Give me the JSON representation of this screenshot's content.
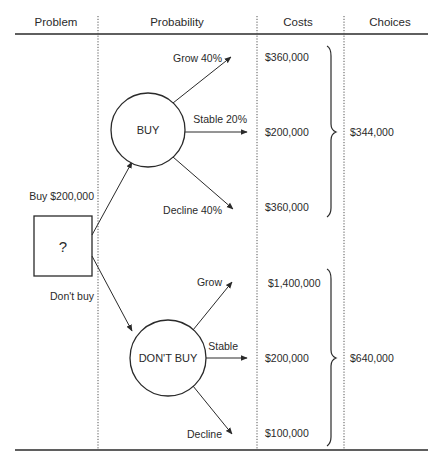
{
  "header": {
    "columns": [
      {
        "label": "Problem"
      },
      {
        "label": "Probability"
      },
      {
        "label": "Costs"
      },
      {
        "label": "Choices"
      }
    ]
  },
  "decision": {
    "symbol": "?",
    "buy_branch_label": "Buy $200,000",
    "dont_buy_branch_label": "Don't buy"
  },
  "nodes": {
    "buy": {
      "label": "BUY",
      "outcomes": [
        {
          "label": "Grow 40%",
          "cost": "$360,000"
        },
        {
          "label": "Stable 20%",
          "cost": "$200,000"
        },
        {
          "label": "Decline 40%",
          "cost": "$360,000"
        }
      ],
      "choice": "$344,000"
    },
    "dont_buy": {
      "label": "DON'T BUY",
      "outcomes": [
        {
          "label": "Grow",
          "cost": "$1,400,000"
        },
        {
          "label": "Stable",
          "cost": "$200,000"
        },
        {
          "label": "Decline",
          "cost": "$100,000"
        }
      ],
      "choice": "$640,000"
    }
  },
  "colors": {
    "ink": "#2a2a2a",
    "background": "#ffffff"
  }
}
